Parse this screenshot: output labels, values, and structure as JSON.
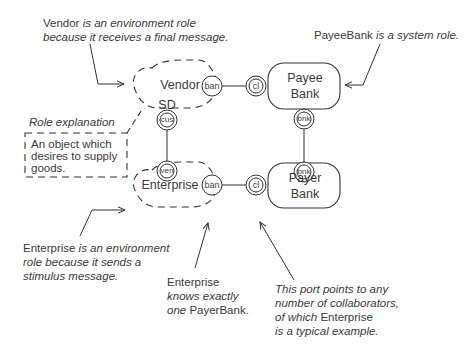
{
  "diagram": {
    "roles": {
      "vendor": {
        "name": "Vendor",
        "stereotype": "SD",
        "kind": "environment"
      },
      "enterprise": {
        "name": "Enterprise",
        "kind": "environment"
      },
      "payee_bank": {
        "line1": "Payee",
        "line2": "Bank",
        "kind": "system"
      },
      "payer_bank": {
        "line1": "Payer",
        "line2": "Bank",
        "kind": "system"
      }
    },
    "ports": {
      "vendor_ban": "ban",
      "payee_cl": "cl",
      "vendor_cus": "cus",
      "enterprise_ven": "ven",
      "enterprise_ban": "ban",
      "payer_cl": "cl",
      "payee_bnk": "bnk",
      "payer_bnk": "bnk"
    },
    "role_explanation": {
      "title": "Role explanation",
      "lines": [
        "An object which",
        "desires to supply",
        "goods."
      ]
    },
    "annotations": {
      "vendor": {
        "line1_name": "Vendor",
        "line1_rest": " is an environment role",
        "line2": "because it receives a final message."
      },
      "payee_bank": {
        "name": "PayeeBank",
        "rest": " is a system role."
      },
      "enterprise_env": {
        "line1_name": "Enterprise",
        "line1_rest": " is an environment",
        "line2": "role because it sends a",
        "line3": "stimulus message."
      },
      "enterprise_knows": {
        "line1": "Enterprise",
        "line2": "knows exactly",
        "line3_it": "one",
        "line3_rest": " PayerBank."
      },
      "port_points": {
        "line1": "This port points to any",
        "line2": "number of collaborators,",
        "line3_it": "of which",
        "line3_name": " Enterprise",
        "line4": "is a typical example."
      }
    },
    "colors": {
      "stroke": "#333333",
      "text": "#3a3a3a",
      "background": "#ffffff"
    }
  }
}
